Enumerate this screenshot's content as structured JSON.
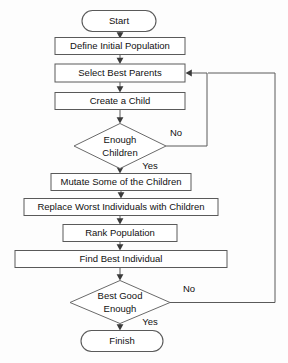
{
  "diagram": {
    "colors": {
      "background": "#fdfdfd",
      "node_fill": "#ffffff",
      "node_stroke": "#5a5a5a",
      "connector": "#5a5a5a",
      "arrowhead": "#3a3a3a",
      "text": "#111111"
    },
    "nodes": [
      {
        "id": "start",
        "type": "terminal",
        "label": "Start",
        "cx": 119,
        "cy": 21,
        "w": 74,
        "h": 21
      },
      {
        "id": "define",
        "type": "process",
        "label": "Define Initial Population",
        "cx": 120,
        "cy": 46,
        "w": 130,
        "h": 17
      },
      {
        "id": "select",
        "type": "process",
        "label": "Select Best Parents",
        "cx": 120,
        "cy": 73,
        "w": 130,
        "h": 18
      },
      {
        "id": "create",
        "type": "process",
        "label": "Create a Child",
        "cx": 120,
        "cy": 101,
        "w": 130,
        "h": 17
      },
      {
        "id": "enough",
        "type": "decision",
        "label": "Enough\nChildren",
        "cx": 120,
        "cy": 146,
        "w": 92,
        "h": 45
      },
      {
        "id": "mutate",
        "type": "process",
        "label": "Mutate Some of the Children",
        "cx": 121,
        "cy": 182,
        "w": 140,
        "h": 17
      },
      {
        "id": "replace",
        "type": "process",
        "label": "Replace Worst Individuals with Children",
        "cx": 121,
        "cy": 207,
        "w": 194,
        "h": 17
      },
      {
        "id": "rank",
        "type": "process",
        "label": "Rank Population",
        "cx": 120,
        "cy": 233,
        "w": 114,
        "h": 17
      },
      {
        "id": "find",
        "type": "process",
        "label": "Find Best Individual",
        "cx": 121,
        "cy": 259,
        "w": 212,
        "h": 17
      },
      {
        "id": "good",
        "type": "decision",
        "label": "Best Good\nEnough",
        "cx": 120,
        "cy": 302,
        "w": 100,
        "h": 43
      },
      {
        "id": "finish",
        "type": "terminal",
        "label": "Finish",
        "cx": 122,
        "cy": 341,
        "w": 82,
        "h": 21
      }
    ],
    "edges": [
      {
        "id": "e-start-define",
        "from": "start",
        "to": "define",
        "kind": "straight-down",
        "label": ""
      },
      {
        "id": "e-define-select",
        "from": "define",
        "to": "select",
        "kind": "straight-down",
        "label": ""
      },
      {
        "id": "e-select-create",
        "from": "select",
        "to": "create",
        "kind": "straight-down",
        "label": ""
      },
      {
        "id": "e-create-enough",
        "from": "create",
        "to": "enough",
        "kind": "straight-down",
        "label": ""
      },
      {
        "id": "e-enough-no",
        "from": "enough",
        "to": "select",
        "kind": "feedback-inner",
        "label": "No"
      },
      {
        "id": "e-enough-yes",
        "from": "enough",
        "to": "mutate",
        "kind": "straight-down",
        "label": "Yes"
      },
      {
        "id": "e-mutate-replace",
        "from": "mutate",
        "to": "replace",
        "kind": "straight-down",
        "label": ""
      },
      {
        "id": "e-replace-rank",
        "from": "replace",
        "to": "rank",
        "kind": "straight-down",
        "label": ""
      },
      {
        "id": "e-rank-find",
        "from": "rank",
        "to": "find",
        "kind": "straight-down",
        "label": ""
      },
      {
        "id": "e-find-good",
        "from": "find",
        "to": "good",
        "kind": "straight-down",
        "label": ""
      },
      {
        "id": "e-good-no",
        "from": "good",
        "to": "select",
        "kind": "feedback-outer",
        "label": "No"
      },
      {
        "id": "e-good-yes",
        "from": "good",
        "to": "finish",
        "kind": "straight-down",
        "label": "Yes"
      }
    ],
    "edge_labels": [
      {
        "id": "label-enough-no",
        "text": "No",
        "x": 176,
        "y": 133
      },
      {
        "id": "label-enough-yes",
        "text": "Yes",
        "x": 150,
        "y": 166
      },
      {
        "id": "label-good-no",
        "text": "No",
        "x": 189,
        "y": 289
      },
      {
        "id": "label-good-yes",
        "text": "Yes",
        "x": 150,
        "y": 322
      }
    ],
    "routing": {
      "inner_return_x": 207,
      "outer_return_x": 275,
      "inner_return_top_y": 73,
      "outer_return_top_y": 73,
      "inner_return_bottom_y": 146,
      "outer_return_bottom_y": 303,
      "select_right_x": 185
    }
  }
}
